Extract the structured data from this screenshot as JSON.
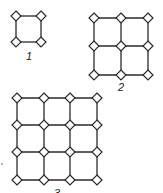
{
  "figure": {
    "colors": {
      "line": "#2a2a2a",
      "node_fill": "#ffffff",
      "background": "#ffffff"
    },
    "node_half_size": 5,
    "grids": [
      {
        "label": "1",
        "n": 2,
        "xs": [
          16,
          41
        ],
        "ys": [
          16,
          42
        ],
        "label_pos": [
          29,
          60
        ]
      },
      {
        "label": "2",
        "n": 3,
        "xs": [
          94,
          121,
          148
        ],
        "ys": [
          18,
          46,
          75
        ],
        "label_pos": [
          121,
          91
        ]
      },
      {
        "label": "3",
        "n": 4,
        "xs": [
          17,
          44,
          70,
          97
        ],
        "ys": [
          98,
          125,
          152,
          180
        ],
        "label_pos": [
          57,
          197
        ]
      }
    ],
    "stray_dot": [
      2,
      164
    ]
  }
}
